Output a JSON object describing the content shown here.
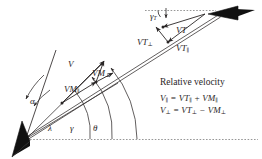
{
  "figure": {
    "type": "vector-diagram",
    "title_text": "Relative velocity",
    "background": "#ffffff",
    "ink": "#231f20",
    "width": 262,
    "height": 159
  },
  "vessels": {
    "own_ship": {
      "name": "own-ship-marker",
      "shape": "black-wedge",
      "x": 24,
      "y": 143
    },
    "target_ship": {
      "name": "target-ship-marker",
      "shape": "black-wedge",
      "x": 222,
      "y": 13
    }
  },
  "vectors": [
    {
      "id": "V",
      "label": "V",
      "sub": "",
      "name": "vector-label-V"
    },
    {
      "id": "VM_perp",
      "label": "VM",
      "sub": "⊥",
      "name": "vector-label-VM-perp"
    },
    {
      "id": "VM_par",
      "label": "VM",
      "sub": "∥",
      "name": "vector-label-VM-parallel"
    },
    {
      "id": "VT",
      "label": "VT",
      "sub": "",
      "name": "vector-label-VT"
    },
    {
      "id": "VT_perp",
      "label": "VT",
      "sub": "⊥",
      "name": "vector-label-VT-perp"
    },
    {
      "id": "VT_par",
      "label": "VT",
      "sub": "∥",
      "name": "vector-label-VT-parallel"
    }
  ],
  "angles": [
    {
      "id": "alpha",
      "label": "α",
      "name": "angle-label-alpha"
    },
    {
      "id": "lambda",
      "label": "λ",
      "name": "angle-label-lambda"
    },
    {
      "id": "gamma",
      "label": "γ",
      "name": "angle-label-gamma"
    },
    {
      "id": "theta",
      "label": "θ",
      "name": "angle-label-theta"
    },
    {
      "id": "gamma_T",
      "label": "γ",
      "sub": "T",
      "name": "angle-label-gamma-T"
    }
  ],
  "equations": {
    "heading": "Relative velocity",
    "eq1": {
      "lhs": "V",
      "lhs_sub": "∥",
      "rhs1": "VT",
      "rhs1_sub": "∥",
      "op": "+",
      "rhs2": "VM",
      "rhs2_sub": "∥"
    },
    "eq2": {
      "lhs": "V",
      "lhs_sub": "⊥",
      "rhs1": "VT",
      "rhs1_sub": "⊥",
      "op": "−",
      "rhs2": "VM",
      "rhs2_sub": "⊥"
    },
    "eq1_text": "V∥ = VT∥ + VM∥",
    "eq2_text": "V⊥ = VT⊥ − VM⊥"
  }
}
